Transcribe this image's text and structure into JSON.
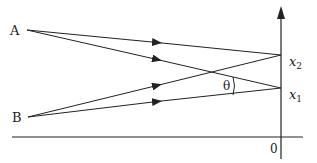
{
  "diagram": {
    "type": "ray-interference-geometry",
    "sources": [
      {
        "label": "A",
        "x": 27,
        "y": 30
      },
      {
        "label": "B",
        "x": 28,
        "y": 117
      }
    ],
    "axis": {
      "origin_label": "0",
      "points": [
        {
          "label": "x",
          "subscript": "2",
          "y": 55
        },
        {
          "label": "x",
          "subscript": "1",
          "y": 88
        }
      ]
    },
    "angle_label": "θ",
    "colors": {
      "line": "#222222",
      "background": "#ffffff"
    }
  },
  "labels": {
    "A": "A",
    "B": "B",
    "x2_main": "x",
    "x2_sub": "2",
    "x1_main": "x",
    "x1_sub": "1",
    "theta": "θ",
    "origin": "0"
  }
}
